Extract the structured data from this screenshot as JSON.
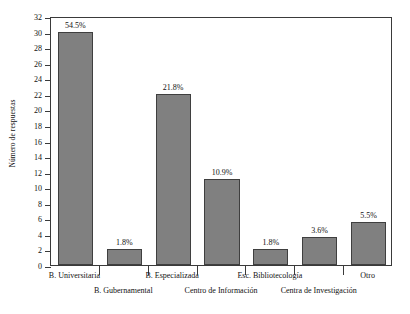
{
  "chart_data": {
    "type": "bar",
    "title": "",
    "xlabel": "",
    "ylabel": "Número de respuestas",
    "ylim": [
      0,
      32
    ],
    "ytick_step": 2,
    "grid": false,
    "legend": false,
    "bar_color": "#808080",
    "bar_border_color": "#3f3f3f",
    "axis_color": "#3a3a3a",
    "categories": [
      "B. Universitaria",
      "B. Gubernamental",
      "B. Especializada",
      "Centro de Información",
      "Esc. Bibliotecología",
      "Centra de Investigación",
      "Otro"
    ],
    "values": [
      30,
      2,
      22,
      11,
      2,
      3.6,
      5.5
    ],
    "data_labels": [
      "54.5%",
      "1.8%",
      "21.8%",
      "10.9%",
      "1.8%",
      "3.6%",
      "5.5%"
    ],
    "yticks": [
      "0",
      "2",
      "4",
      "6",
      "8",
      "10",
      "12",
      "14",
      "16",
      "18",
      "20",
      "22",
      "24",
      "26",
      "28",
      "30",
      "32"
    ]
  }
}
